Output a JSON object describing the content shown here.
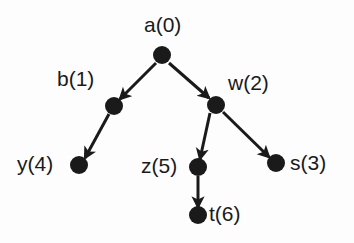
{
  "figure": {
    "type": "directed-graph",
    "title": "",
    "background_color": "#fdfdfd",
    "node_color": "#1a1a1a",
    "edge_color": "#1a1a1a",
    "label_color": "#1a1a1a",
    "node_radius": 9,
    "edge_width": 3
  },
  "nodes": [
    {
      "id": "a",
      "label": "a(0)",
      "name": "a",
      "order": 0,
      "x": 162,
      "y": 55,
      "label_x": 144,
      "label_y": 14,
      "label_anchor": "above"
    },
    {
      "id": "b",
      "label": "b(1)",
      "name": "b",
      "order": 1,
      "x": 114,
      "y": 106,
      "label_x": 57,
      "label_y": 68,
      "label_anchor": "above-left"
    },
    {
      "id": "w",
      "label": "w(2)",
      "name": "w",
      "order": 2,
      "x": 216,
      "y": 105,
      "label_x": 228,
      "label_y": 72,
      "label_anchor": "above-right"
    },
    {
      "id": "s",
      "label": "s(3)",
      "name": "s",
      "order": 3,
      "x": 276,
      "y": 163,
      "label_x": 290,
      "label_y": 152,
      "label_anchor": "right"
    },
    {
      "id": "y",
      "label": "y(4)",
      "name": "y",
      "order": 4,
      "x": 79,
      "y": 165,
      "label_x": 17,
      "label_y": 153,
      "label_anchor": "left"
    },
    {
      "id": "z",
      "label": "z(5)",
      "name": "z",
      "order": 5,
      "x": 198,
      "y": 167,
      "label_x": 141,
      "label_y": 155,
      "label_anchor": "left"
    },
    {
      "id": "t",
      "label": "t(6)",
      "name": "t",
      "order": 6,
      "x": 198,
      "y": 215,
      "label_x": 209,
      "label_y": 203,
      "label_anchor": "right"
    }
  ],
  "edges": [
    {
      "from": "a",
      "to": "b",
      "x1": 156,
      "y1": 63,
      "x2": 120,
      "y2": 99,
      "directed": true
    },
    {
      "from": "a",
      "to": "w",
      "x1": 169,
      "y1": 63,
      "x2": 209,
      "y2": 98,
      "directed": true
    },
    {
      "from": "b",
      "to": "y",
      "x1": 109,
      "y1": 114,
      "x2": 85,
      "y2": 158,
      "directed": true
    },
    {
      "from": "w",
      "to": "z",
      "x1": 210,
      "y1": 113,
      "x2": 200,
      "y2": 159,
      "directed": true
    },
    {
      "from": "w",
      "to": "s",
      "x1": 223,
      "y1": 112,
      "x2": 269,
      "y2": 157,
      "directed": true
    },
    {
      "from": "z",
      "to": "t",
      "x1": 198,
      "y1": 176,
      "x2": 198,
      "y2": 207,
      "directed": true
    }
  ]
}
